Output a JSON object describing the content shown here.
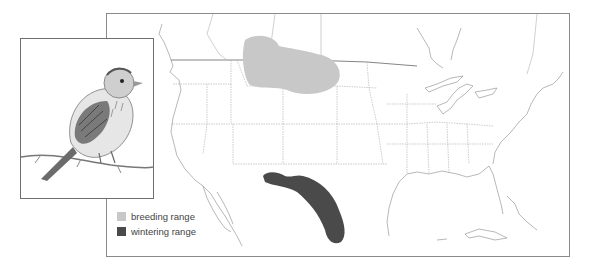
{
  "map": {
    "region": "North America (Canada, United States, Mexico)",
    "frame_color": "#8a8a8a"
  },
  "illustration": {
    "subject": "sparrow perched on twig",
    "style": "grayscale pencil drawing"
  },
  "legend": {
    "items": [
      {
        "label": "breeding range",
        "color": "#c8c8c8"
      },
      {
        "label": "wintering range",
        "color": "#4a4a4a"
      }
    ]
  },
  "ranges": {
    "breeding": {
      "color": "#c8c8c8",
      "area": "southern Canadian prairies and northern Great Plains"
    },
    "wintering": {
      "color": "#4a4a4a",
      "area": "southwestern US border into northern and central Mexico"
    }
  }
}
